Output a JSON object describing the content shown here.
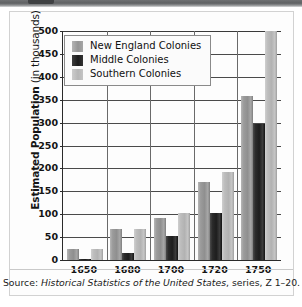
{
  "chart_data": {
    "type": "bar",
    "title": "",
    "xlabel": "",
    "ylabel": "Estimated Population (in thousands)",
    "ylabel_main": "Estimated Population",
    "ylabel_sub": " (in thousands)",
    "categories": [
      "1650",
      "1680",
      "1700",
      "1720",
      "1750"
    ],
    "ylim": [
      0,
      500
    ],
    "yticks": [
      0,
      50,
      100,
      150,
      200,
      250,
      300,
      350,
      400,
      450,
      500
    ],
    "grid": true,
    "legend_position": "top-left",
    "series": [
      {
        "name": "New England Colonies",
        "color": "#989898",
        "values": [
          23,
          68,
          92,
          170,
          358
        ]
      },
      {
        "name": "Middle Colonies",
        "color": "#1d1d1d",
        "values": [
          3,
          15,
          52,
          103,
          296
        ]
      },
      {
        "name": "Southern Colonies",
        "color": "#bcbcbc",
        "values": [
          23,
          68,
          103,
          192,
          512
        ]
      }
    ],
    "annotations": [
      "Southern Colonies bar for 1750 extends above the 500 gridline and is clipped by the plot frame."
    ]
  },
  "source": {
    "prefix": "Source: ",
    "italic_title": "Historical Statistics of the United States",
    "suffix": ", series, Z 1–20."
  }
}
